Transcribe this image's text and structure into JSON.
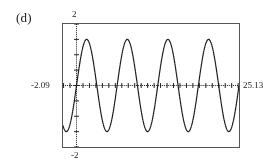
{
  "figure": {
    "panel_label": "(d)",
    "frame_color": "#555555",
    "curve_color": "#1a1a1a",
    "background": "#ffffff"
  },
  "labels": {
    "y_max": "2",
    "y_min": "-2",
    "x_min": "-2.09",
    "x_max": "25.13"
  },
  "chart_data": {
    "type": "line",
    "title": "",
    "xlabel": "",
    "ylabel": "",
    "xlim": [
      -2.09,
      25.13
    ],
    "ylim": [
      -2,
      2
    ],
    "grid": false,
    "legend": null,
    "style": "dotted-pixel-trace",
    "axis_ticks": {
      "x_tick_spacing": 1,
      "y_tick_spacing": 0.5
    },
    "series": [
      {
        "name": "y = 1.5 sin(x)",
        "amplitude": 1.5,
        "period": 6.283,
        "phase": 0,
        "x": [
          -2.09,
          -1.8,
          -1.5,
          -1.2,
          -0.9,
          -0.6,
          -0.3,
          0,
          0.3,
          0.6,
          0.9,
          1.2,
          1.5,
          1.8,
          2.1,
          2.4,
          2.7,
          3,
          3.3,
          3.6,
          3.9,
          4.2,
          4.5,
          4.8,
          5.1,
          5.4,
          5.7,
          6,
          6.3,
          6.6,
          6.9,
          7.2,
          7.5,
          7.8,
          8.1,
          8.4,
          8.7,
          9,
          9.3,
          9.6,
          9.9,
          10.2,
          10.5,
          10.8,
          11.1,
          11.4,
          11.7,
          12,
          12.3,
          12.6,
          12.9,
          13.2,
          13.5,
          13.8,
          14.1,
          14.4,
          14.7,
          15,
          15.3,
          15.6,
          15.9,
          16.2,
          16.5,
          16.8,
          17.1,
          17.4,
          17.7,
          18,
          18.3,
          18.6,
          18.9,
          19.2,
          19.5,
          19.8,
          20.1,
          20.4,
          20.7,
          21,
          21.3,
          21.6,
          21.9,
          22.2,
          22.5,
          22.8,
          23.1,
          23.4,
          23.7,
          24,
          24.3,
          24.6,
          24.9,
          25.13
        ],
        "y": [
          -1.3,
          -1.46,
          -1.5,
          -1.4,
          -1.17,
          -0.85,
          -0.44,
          0,
          0.44,
          0.85,
          1.17,
          1.4,
          1.5,
          1.46,
          1.29,
          1.01,
          0.64,
          0.21,
          -0.24,
          -0.67,
          -1.03,
          -1.31,
          -1.47,
          -1.5,
          -1.38,
          -1.15,
          -0.8,
          -0.42,
          0.02,
          0.46,
          0.87,
          1.19,
          1.41,
          1.5,
          1.45,
          1.28,
          0.99,
          0.62,
          0.18,
          -0.26,
          -0.69,
          -1.05,
          -1.32,
          -1.47,
          -1.49,
          -1.37,
          -1.13,
          -0.8,
          -0.39,
          0.05,
          0.49,
          0.89,
          1.21,
          1.42,
          1.5,
          1.44,
          1.26,
          0.97,
          0.59,
          0.15,
          -0.29,
          -0.71,
          -1.07,
          -1.33,
          -1.48,
          -1.49,
          -1.36,
          -1.12,
          -0.77,
          -0.37,
          0.08,
          0.52,
          0.91,
          1.22,
          1.43,
          1.5,
          1.43,
          1.25,
          0.95,
          0.56,
          0.12,
          -0.32,
          -0.74,
          -1.09,
          -1.34,
          -1.48,
          -1.49,
          -1.35,
          -1.1,
          -0.75,
          -0.34,
          -0.12
        ]
      }
    ]
  }
}
